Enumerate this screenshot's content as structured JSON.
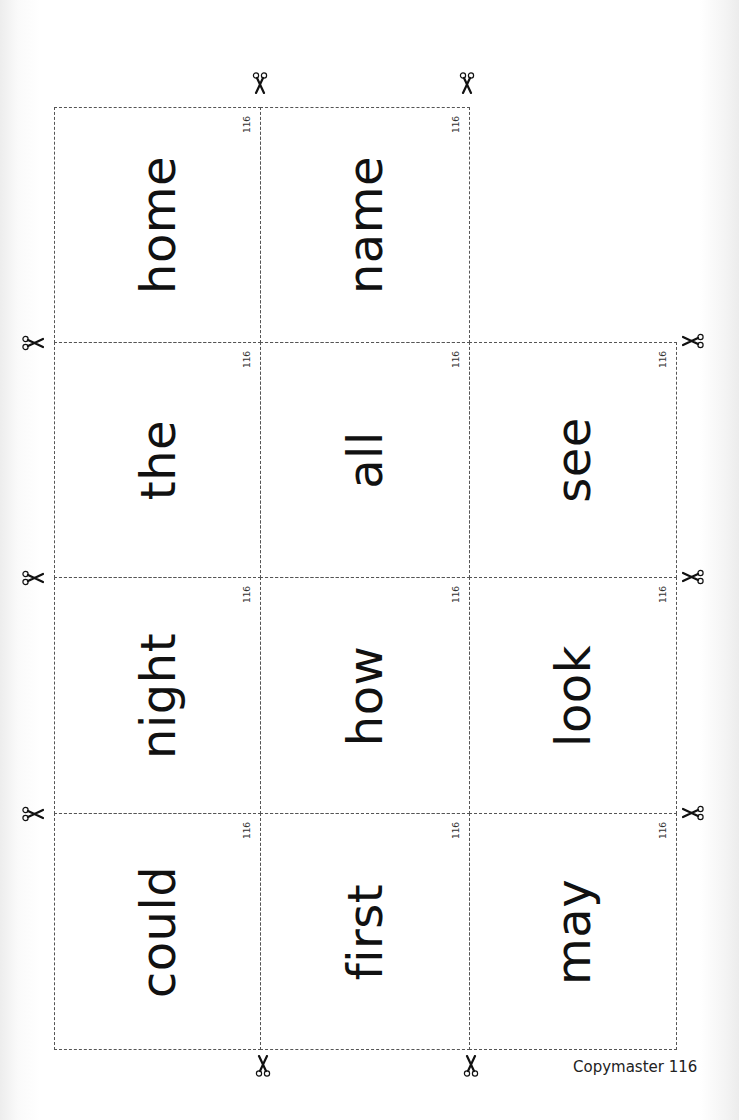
{
  "page": {
    "footer_label": "Copymaster 116",
    "card_number": "116",
    "line_color": "#555555",
    "text_color": "#111111"
  },
  "cards": [
    {
      "word": "home",
      "row": 0,
      "col": 0
    },
    {
      "word": "name",
      "row": 0,
      "col": 1
    },
    {
      "word": "the",
      "row": 1,
      "col": 0
    },
    {
      "word": "all",
      "row": 1,
      "col": 1
    },
    {
      "word": "see",
      "row": 1,
      "col": 2
    },
    {
      "word": "night",
      "row": 2,
      "col": 0
    },
    {
      "word": "how",
      "row": 2,
      "col": 1
    },
    {
      "word": "look",
      "row": 2,
      "col": 2
    },
    {
      "word": "could",
      "row": 3,
      "col": 0
    },
    {
      "word": "first",
      "row": 3,
      "col": 1
    },
    {
      "word": "may",
      "row": 3,
      "col": 2
    }
  ],
  "icons": {
    "scissors": "scissors-icon"
  }
}
